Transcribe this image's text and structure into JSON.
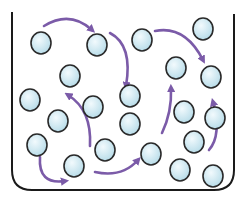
{
  "diagram": {
    "container": {
      "stroke": "#1a1a1a"
    },
    "colors": {
      "arrow": "#7b5ba8",
      "particle_fill_light": "#f2fafd",
      "particle_fill_dark": "#b5dbe8",
      "particle_stroke": "#2a2a2a"
    },
    "particles": [
      {
        "x": 41,
        "y": 43
      },
      {
        "x": 97,
        "y": 45
      },
      {
        "x": 142,
        "y": 40
      },
      {
        "x": 203,
        "y": 29
      },
      {
        "x": 70,
        "y": 76
      },
      {
        "x": 176,
        "y": 68
      },
      {
        "x": 211,
        "y": 77
      },
      {
        "x": 30,
        "y": 100
      },
      {
        "x": 93,
        "y": 107
      },
      {
        "x": 130,
        "y": 96
      },
      {
        "x": 58,
        "y": 121
      },
      {
        "x": 184,
        "y": 112
      },
      {
        "x": 215,
        "y": 118
      },
      {
        "x": 130,
        "y": 124
      },
      {
        "x": 37,
        "y": 145
      },
      {
        "x": 105,
        "y": 150
      },
      {
        "x": 151,
        "y": 154
      },
      {
        "x": 194,
        "y": 142
      },
      {
        "x": 74,
        "y": 166
      },
      {
        "x": 180,
        "y": 170
      },
      {
        "x": 213,
        "y": 176
      }
    ],
    "arrows": [
      {
        "d": "M44 26 Q70 10 92 30"
      },
      {
        "d": "M110 33 Q133 45 126 86"
      },
      {
        "d": "M155 31 Q185 25 203 60"
      },
      {
        "d": "M90 146 Q92 110 68 95"
      },
      {
        "d": "M40 157 Q38 185 65 181"
      },
      {
        "d": "M95 172 Q122 178 138 160"
      },
      {
        "d": "M162 133 Q172 112 171 88"
      },
      {
        "d": "M209 150 Q222 135 213 102"
      }
    ]
  }
}
